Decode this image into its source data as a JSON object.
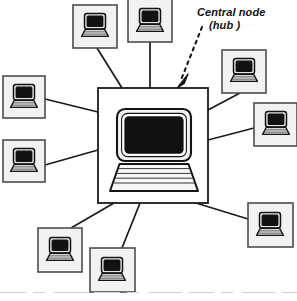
{
  "diagram": {
    "type": "network-topology",
    "topology": "star",
    "background_color": "#ffffff",
    "line_color": "#1a1a1a",
    "node_fill_color": "#f2f2f2",
    "node_border_color": "#4d4d4d",
    "screen_color": "#111111",
    "laptop_body_color": "#e8e8e8",
    "annotation": {
      "line1": "Central node",
      "line2": "(hub )",
      "style": "italic",
      "pointer": "dashed-arrow",
      "pointer_target": "central-node"
    },
    "central_node": {
      "label": "Central node (hub )",
      "icon": "computer-icon",
      "x": 98,
      "y": 88,
      "width": 110,
      "height": 115
    },
    "peripheral_nodes": [
      {
        "id": "node-top-left",
        "icon": "laptop-icon",
        "x": 73,
        "y": 5,
        "width": 44,
        "height": 43
      },
      {
        "id": "node-top-center",
        "icon": "laptop-icon",
        "x": 128,
        "y": 0,
        "width": 44,
        "height": 42
      },
      {
        "id": "node-left-upper",
        "icon": "laptop-icon",
        "x": 3,
        "y": 76,
        "width": 42,
        "height": 42
      },
      {
        "id": "node-left-lower",
        "icon": "laptop-icon",
        "x": 3,
        "y": 140,
        "width": 42,
        "height": 42
      },
      {
        "id": "node-right-upper",
        "icon": "laptop-icon",
        "x": 222,
        "y": 50,
        "width": 44,
        "height": 43
      },
      {
        "id": "node-right-middle",
        "icon": "laptop-icon",
        "x": 254,
        "y": 103,
        "width": 43,
        "height": 43
      },
      {
        "id": "node-bottom-right",
        "icon": "laptop-icon",
        "x": 248,
        "y": 203,
        "width": 45,
        "height": 44
      },
      {
        "id": "node-bottom-left",
        "icon": "laptop-icon",
        "x": 38,
        "y": 228,
        "width": 44,
        "height": 44
      },
      {
        "id": "node-bottom-center",
        "icon": "laptop-icon",
        "x": 90,
        "y": 248,
        "width": 45,
        "height": 44
      }
    ],
    "links": [
      {
        "id": "link-top-left",
        "from": "central-node",
        "to": "node-top-left",
        "x1": 122,
        "y1": 88,
        "x2": 97,
        "y2": 48
      },
      {
        "id": "link-top-center",
        "from": "central-node",
        "to": "node-top-center",
        "x1": 150,
        "y1": 88,
        "x2": 150,
        "y2": 42
      },
      {
        "id": "link-left-upper",
        "from": "central-node",
        "to": "node-left-upper",
        "x1": 98,
        "y1": 112,
        "x2": 45,
        "y2": 99
      },
      {
        "id": "link-left-lower",
        "from": "central-node",
        "to": "node-left-lower",
        "x1": 98,
        "y1": 150,
        "x2": 45,
        "y2": 165
      },
      {
        "id": "link-right-upper",
        "from": "central-node",
        "to": "node-right-upper",
        "x1": 208,
        "y1": 110,
        "x2": 240,
        "y2": 93
      },
      {
        "id": "link-right-middle",
        "from": "central-node",
        "to": "node-right-middle",
        "x1": 208,
        "y1": 140,
        "x2": 254,
        "y2": 128
      },
      {
        "id": "link-bottom-right",
        "from": "central-node",
        "to": "node-bottom-right",
        "x1": 196,
        "y1": 203,
        "x2": 248,
        "y2": 219
      },
      {
        "id": "link-bottom-left",
        "from": "central-node",
        "to": "node-bottom-left",
        "x1": 114,
        "y1": 203,
        "x2": 71,
        "y2": 228
      },
      {
        "id": "link-bottom-center",
        "from": "central-node",
        "to": "node-bottom-center",
        "x1": 140,
        "y1": 203,
        "x2": 122,
        "y2": 248
      }
    ],
    "pointer_arrow": {
      "id": "hub-pointer-arrow",
      "x1": 202,
      "y1": 27,
      "x2": 180,
      "y2": 84,
      "dash_pattern": "3 4",
      "tip_x": 177,
      "tip_y": 88
    },
    "scan_artifact": {
      "id": "scan-artifact-line",
      "y": 292,
      "color": "#cfcfcf"
    }
  }
}
